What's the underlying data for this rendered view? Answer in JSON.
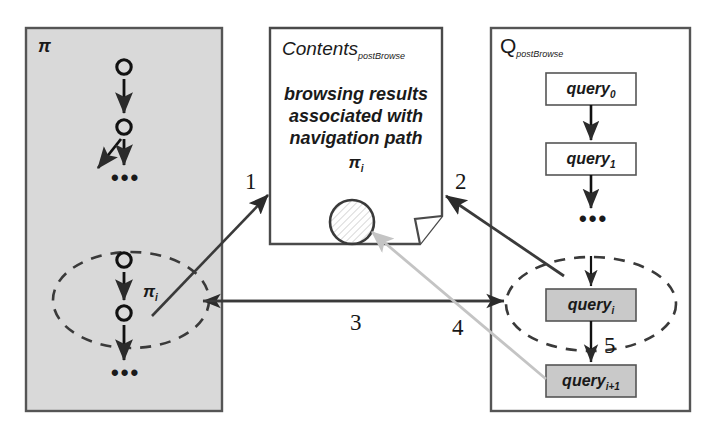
{
  "diagram": {
    "title_hidden": "",
    "panels": {
      "path": {
        "label": "π",
        "fill": "#d9d9d9",
        "border": "#555555",
        "nodes_top_dots": "•••",
        "nodes_bottom_dots": "•••",
        "ellipse_label": "π",
        "ellipse_label_sub": "i"
      },
      "contents": {
        "title_main": "Contents",
        "title_sub": "postBrowse",
        "body_line1": "browsing results",
        "body_line2": "associated with",
        "body_line3": "navigation path",
        "body_symbol": "π",
        "body_symbol_sub": "i",
        "fill": "#ffffff",
        "border": "#4a4a4a",
        "circle_name": "hatched-result-circle"
      },
      "queries": {
        "title_main": "Q",
        "title_sub": "postBrowse",
        "fill": "#ffffff",
        "border": "#555555",
        "box_fill_plain": "#ffffff",
        "box_fill_highlight": "#c9c9c9",
        "dots": "•••",
        "items": [
          {
            "label": "query",
            "sub": "0",
            "highlight": false
          },
          {
            "label": "query",
            "sub": "1",
            "highlight": false
          },
          {
            "label": "query",
            "sub": "i",
            "highlight": true
          },
          {
            "label": "query",
            "sub": "i+1",
            "highlight": true
          }
        ]
      }
    },
    "step_labels": [
      {
        "id": "1",
        "text": "1"
      },
      {
        "id": "2",
        "text": "2"
      },
      {
        "id": "3",
        "text": "3"
      },
      {
        "id": "4",
        "text": "4"
      },
      {
        "id": "5",
        "text": "5"
      }
    ],
    "colors": {
      "ink": "#333333",
      "ink_dark": "#1a1a1a",
      "gray_arrow": "#c4c4c4",
      "panel_gray": "#d9d9d9",
      "box_gray": "#c9c9c9"
    }
  }
}
